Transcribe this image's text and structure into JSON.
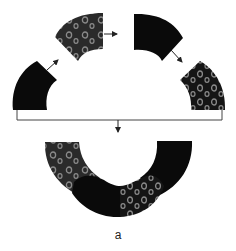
{
  "figure": {
    "caption": "a",
    "colors": {
      "background": "#ffffff",
      "solid_tile": "#0a0a0a",
      "patterned_tile": "#151515",
      "patterned_tile_alt": "#2a2a2a",
      "ring_pattern": "#8a8a8a",
      "arrow": "#222222",
      "bracket": "#444444"
    },
    "pieces": [
      {
        "id": "piece-1",
        "fill": "solid",
        "position": "left"
      },
      {
        "id": "piece-2",
        "fill": "patterned",
        "position": "top-left"
      },
      {
        "id": "piece-3",
        "fill": "solid",
        "position": "top-right"
      },
      {
        "id": "piece-4",
        "fill": "patterned",
        "position": "right"
      }
    ],
    "arrows": [
      {
        "from": "piece-1",
        "to": "piece-2"
      },
      {
        "from": "piece-2",
        "to": "piece-3"
      },
      {
        "from": "piece-3",
        "to": "piece-4"
      },
      {
        "from": "bracket",
        "to": "assembled-ring"
      }
    ],
    "assembled": {
      "description": "Four tiles joined into a scalloped ring arc"
    }
  }
}
